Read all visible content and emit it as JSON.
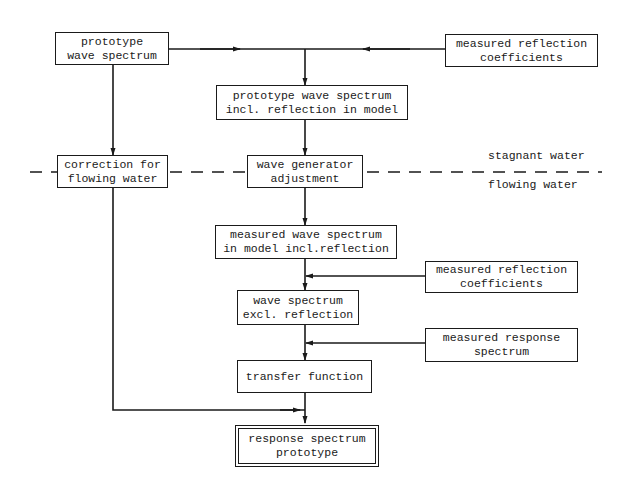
{
  "diagram": {
    "type": "flowchart",
    "colors": {
      "ink": "#1a1a1a",
      "background": "#ffffff"
    },
    "boundary": {
      "above_label": "stagnant water",
      "below_label": "flowing water"
    },
    "nodes": {
      "prototype_spectrum": {
        "line1": "prototype",
        "line2": "wave spectrum"
      },
      "measured_reflection_top": {
        "line1": "measured reflection",
        "line2": "coefficients"
      },
      "prototype_incl_reflection": {
        "line1": "prototype wave spectrum",
        "line2": "incl. reflection in model"
      },
      "correction_flowing": {
        "line1": "correction for",
        "line2": "flowing water"
      },
      "wave_generator": {
        "line1": "wave generator",
        "line2": "adjustment"
      },
      "measured_model_spectrum": {
        "line1": "measured wave spectrum",
        "line2": "in model incl.reflection"
      },
      "measured_reflection_mid": {
        "line1": "measured reflection",
        "line2": "coefficients"
      },
      "spectrum_excl_reflection": {
        "line1": "wave spectrum",
        "line2": "excl. reflection"
      },
      "measured_response": {
        "line1": "measured response",
        "line2": "spectrum"
      },
      "transfer_function": {
        "line1": "transfer function"
      },
      "response_prototype": {
        "line1": "response spectrum",
        "line2": "prototype"
      }
    },
    "edges": [
      {
        "from": "prototype_spectrum",
        "to": "prototype_incl_reflection"
      },
      {
        "from": "measured_reflection_top",
        "to": "prototype_incl_reflection"
      },
      {
        "from": "prototype_spectrum",
        "to": "correction_flowing"
      },
      {
        "from": "prototype_incl_reflection",
        "to": "wave_generator"
      },
      {
        "from": "wave_generator",
        "to": "measured_model_spectrum"
      },
      {
        "from": "measured_model_spectrum",
        "to": "spectrum_excl_reflection"
      },
      {
        "from": "measured_reflection_mid",
        "to": "spectrum_excl_reflection"
      },
      {
        "from": "spectrum_excl_reflection",
        "to": "transfer_function"
      },
      {
        "from": "measured_response",
        "to": "transfer_function"
      },
      {
        "from": "transfer_function",
        "to": "response_prototype"
      },
      {
        "from": "correction_flowing",
        "to": "response_prototype"
      }
    ]
  }
}
